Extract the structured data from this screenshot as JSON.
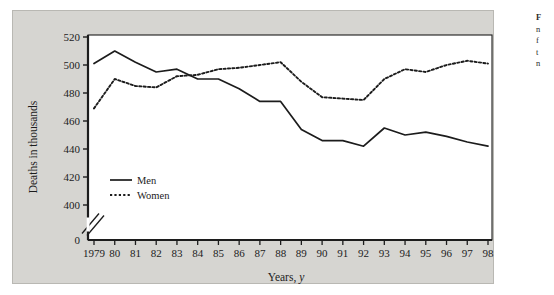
{
  "figure": {
    "panel_bg": "#d6d5d1",
    "plot_bg": "#ffffff",
    "ink": "#1c1c1c"
  },
  "caption": {
    "lines": [
      "F",
      "n",
      "f",
      "t",
      "n"
    ]
  },
  "chart_data": {
    "type": "line",
    "title": "",
    "xlabel": "Years,",
    "xlabel_italic": "y",
    "ylabel": "Deaths in thousands",
    "x": [
      1979,
      1980,
      1981,
      1982,
      1983,
      1984,
      1985,
      1986,
      1987,
      1988,
      1989,
      1990,
      1991,
      1992,
      1993,
      1994,
      1995,
      1996,
      1997,
      1998
    ],
    "x_tick_labels": [
      "1979",
      "80",
      "81",
      "82",
      "83",
      "84",
      "85",
      "86",
      "87",
      "88",
      "89",
      "90",
      "91",
      "92",
      "93",
      "94",
      "95",
      "96",
      "97",
      "98"
    ],
    "y_tick_labels": [
      "0",
      "400",
      "420",
      "440",
      "460",
      "480",
      "500",
      "520"
    ],
    "y_ticks": [
      0,
      400,
      420,
      440,
      460,
      480,
      500,
      520
    ],
    "ylim": [
      400,
      520
    ],
    "axis_break": true,
    "axis_break_between": [
      0,
      400
    ],
    "grid": false,
    "legend_position": "inside-lower-left",
    "series": [
      {
        "name": "Men",
        "style": "solid",
        "color": "#1c1c1c",
        "values": [
          501,
          510,
          502,
          495,
          497,
          490,
          490,
          483,
          474,
          474,
          454,
          446,
          446,
          442,
          455,
          450,
          452,
          449,
          445,
          442
        ]
      },
      {
        "name": "Women",
        "style": "dotted",
        "color": "#1c1c1c",
        "values": [
          469,
          490,
          485,
          484,
          492,
          493,
          497,
          498,
          500,
          502,
          488,
          477,
          476,
          475,
          490,
          497,
          495,
          500,
          503,
          501
        ]
      }
    ]
  }
}
